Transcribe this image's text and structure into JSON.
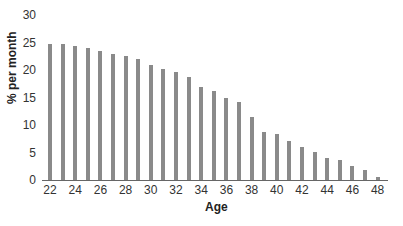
{
  "chart_data": {
    "type": "bar",
    "title": "",
    "xlabel": "Age",
    "ylabel": "% per month",
    "ylim": [
      0,
      30
    ],
    "yticks": [
      0,
      5,
      10,
      15,
      20,
      25,
      30
    ],
    "xticks": [
      22,
      24,
      26,
      28,
      30,
      32,
      34,
      36,
      38,
      40,
      42,
      44,
      46,
      48
    ],
    "grid": false,
    "legend": null,
    "bar_color": "#8a8a8a",
    "categories": [
      22,
      23,
      24,
      25,
      26,
      27,
      28,
      29,
      30,
      31,
      32,
      33,
      34,
      35,
      36,
      37,
      38,
      39,
      40,
      41,
      42,
      43,
      44,
      45,
      46,
      47,
      48
    ],
    "values": [
      24.8,
      24.8,
      24.3,
      24.0,
      23.4,
      22.9,
      22.5,
      22.0,
      21.0,
      20.2,
      19.6,
      18.8,
      17.0,
      16.2,
      15.0,
      14.1,
      11.5,
      8.7,
      8.4,
      7.1,
      6.0,
      5.1,
      4.0,
      3.6,
      2.5,
      1.8,
      0.5
    ]
  }
}
